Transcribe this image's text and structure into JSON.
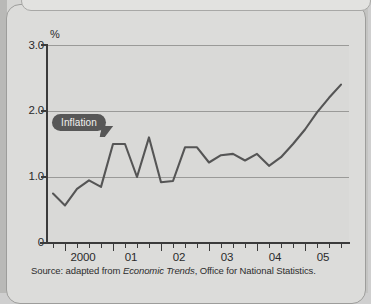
{
  "figure": {
    "y_unit_label": "%",
    "source_prefix": "Source: adapted from ",
    "source_italic": "Economic Trends",
    "source_suffix": ", Office for National Statistics.",
    "callout_label": "Inflation"
  },
  "colors": {
    "line": "#555555",
    "callout_bg": "#575757",
    "callout_text": "#f0f0ee",
    "plot_bg": "#d9d9d7",
    "grid": "#9a9a98",
    "axis": "#3b3b3b",
    "page_bg": "#dcdcda"
  },
  "chart_data": {
    "type": "line",
    "title": "",
    "subtitle": "",
    "xlabel": "",
    "ylabel": "%",
    "ylim": [
      0,
      3.0
    ],
    "y_ticks": [
      "0",
      "1.0",
      "2.0",
      "3.0"
    ],
    "y_tick_values": [
      0,
      1.0,
      2.0,
      3.0
    ],
    "grid": true,
    "grid_lines_at": [
      1.0,
      2.0,
      3.0
    ],
    "legend": "none",
    "x_major_ticks": [
      "2000",
      "01",
      "02",
      "03",
      "04",
      "05"
    ],
    "x_minor_ticks_per_year": 4,
    "series": [
      {
        "name": "Inflation",
        "x": [
          "1999 Q4",
          "2000 Q1",
          "2000 Q2",
          "2000 Q3",
          "2000 Q4",
          "2001 Q1",
          "2001 Q2",
          "2001 Q3",
          "2001 Q4",
          "2002 Q1",
          "2002 Q2",
          "2002 Q3",
          "2002 Q4",
          "2003 Q1",
          "2003 Q2",
          "2003 Q3",
          "2003 Q4",
          "2004 Q1",
          "2004 Q2",
          "2004 Q3",
          "2004 Q4",
          "2005 Q1",
          "2005 Q2",
          "2005 Q3",
          "2005 Q4"
        ],
        "values": [
          0.75,
          0.57,
          0.82,
          0.95,
          0.85,
          1.5,
          1.5,
          1.0,
          1.6,
          0.92,
          0.94,
          1.45,
          1.45,
          1.22,
          1.33,
          1.35,
          1.25,
          1.35,
          1.17,
          1.3,
          1.5,
          1.72,
          1.98,
          2.2,
          2.4
        ]
      }
    ],
    "annotations": [
      {
        "text": "Inflation",
        "points_to_value": 1.5,
        "style": "dark-bubble"
      }
    ]
  }
}
